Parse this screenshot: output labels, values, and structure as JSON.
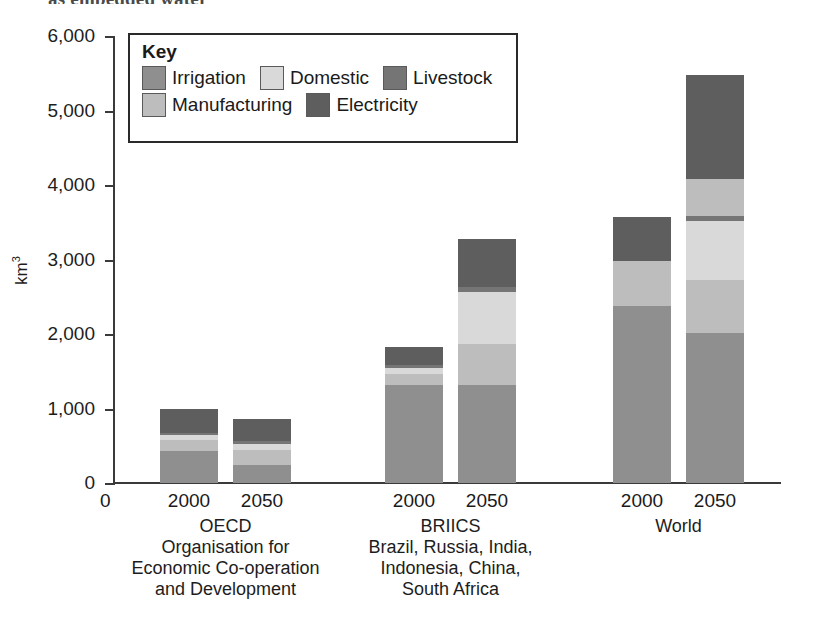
{
  "top_clipped_caption": "as embedded water",
  "axis": {
    "y_title": "km",
    "y_title_sup": "3",
    "y_ticks": [
      "6,000",
      "5,000",
      "4,000",
      "3,000",
      "2,000",
      "1,000",
      "0"
    ],
    "y_min": 0,
    "y_max": 6000,
    "x_zero_label": "0"
  },
  "legend": {
    "title": "Key",
    "row1": [
      {
        "label": "Irrigation",
        "color": "#8f8f8f"
      },
      {
        "label": "Domestic",
        "color": "#d9d9d9"
      },
      {
        "label": "Livestock",
        "color": "#757575"
      }
    ],
    "row2": [
      {
        "label": "Manufacturing",
        "color": "#bdbdbd"
      },
      {
        "label": "Electricity",
        "color": "#5e5e5e"
      }
    ]
  },
  "groups": [
    {
      "name": "OECD",
      "caption_lines": [
        "OECD",
        "Organisation for",
        "Economic Co-operation",
        "and Development"
      ],
      "bars": [
        {
          "year": "2000"
        },
        {
          "year": "2050"
        }
      ]
    },
    {
      "name": "BRIICS",
      "caption_lines": [
        "BRIICS",
        "Brazil, Russia, India,",
        "Indonesia, China,",
        "South Africa"
      ],
      "bars": [
        {
          "year": "2000"
        },
        {
          "year": "2050"
        }
      ]
    },
    {
      "name": "World",
      "caption_lines": [
        "World"
      ],
      "bars": [
        {
          "year": "2000"
        },
        {
          "year": "2050"
        }
      ]
    }
  ],
  "chart_data": {
    "type": "bar",
    "subtype": "stacked",
    "title": "",
    "xlabel": "",
    "ylabel": "km3",
    "ylim": [
      0,
      6000
    ],
    "ytick_step": 1000,
    "grid": false,
    "legend_position": "top-left-inside",
    "categories": [
      "OECD 2000",
      "OECD 2050",
      "BRIICS 2000",
      "BRIICS 2050",
      "World 2000",
      "World 2050"
    ],
    "series": [
      {
        "name": "Irrigation",
        "color": "#8f8f8f",
        "values": [
          430,
          240,
          1320,
          1310,
          2380,
          2020
        ]
      },
      {
        "name": "Domestic",
        "color": "#d9d9d9",
        "values": [
          60,
          90,
          70,
          700,
          0,
          800
        ]
      },
      {
        "name": "Livestock",
        "color": "#757575",
        "values": [
          30,
          40,
          50,
          60,
          0,
          60
        ]
      },
      {
        "name": "Manufacturing",
        "color": "#bdbdbd",
        "values": [
          150,
          200,
          150,
          560,
          600,
          1200
        ]
      },
      {
        "name": "Electricity",
        "color": "#5e5e5e",
        "values": [
          320,
          290,
          230,
          640,
          590,
          1400
        ]
      }
    ],
    "totals": [
      990,
      860,
      1820,
      3270,
      3570,
      5480
    ],
    "units": "km3"
  },
  "bar_geometry": {
    "note": "stack order bottom->top per bar, heights in km3",
    "stacks": [
      [
        {
          "s": "Irrigation",
          "v": 430
        },
        {
          "s": "Manufacturing",
          "v": 150
        },
        {
          "s": "Domestic",
          "v": 60
        },
        {
          "s": "Livestock",
          "v": 30
        },
        {
          "s": "Electricity",
          "v": 320
        }
      ],
      [
        {
          "s": "Irrigation",
          "v": 240
        },
        {
          "s": "Manufacturing",
          "v": 200
        },
        {
          "s": "Domestic",
          "v": 90
        },
        {
          "s": "Livestock",
          "v": 40
        },
        {
          "s": "Electricity",
          "v": 290
        }
      ],
      [
        {
          "s": "Irrigation",
          "v": 1320
        },
        {
          "s": "Manufacturing",
          "v": 150
        },
        {
          "s": "Domestic",
          "v": 70
        },
        {
          "s": "Livestock",
          "v": 50
        },
        {
          "s": "Electricity",
          "v": 230
        }
      ],
      [
        {
          "s": "Irrigation",
          "v": 1310
        },
        {
          "s": "Manufacturing",
          "v": 560
        },
        {
          "s": "Domestic",
          "v": 700
        },
        {
          "s": "Livestock",
          "v": 60
        },
        {
          "s": "Electricity",
          "v": 640
        }
      ],
      [
        {
          "s": "Irrigation",
          "v": 2380
        },
        {
          "s": "Manufacturing",
          "v": 600
        },
        {
          "s": "Electricity",
          "v": 590
        }
      ],
      [
        {
          "s": "Irrigation",
          "v": 2020
        },
        {
          "s": "Manufacturing",
          "v": 700
        },
        {
          "s": "Domestic",
          "v": 800
        },
        {
          "s": "Livestock",
          "v": 60
        },
        {
          "s": "Manufacturing",
          "v": 500
        },
        {
          "s": "Electricity",
          "v": 1400
        }
      ]
    ]
  }
}
